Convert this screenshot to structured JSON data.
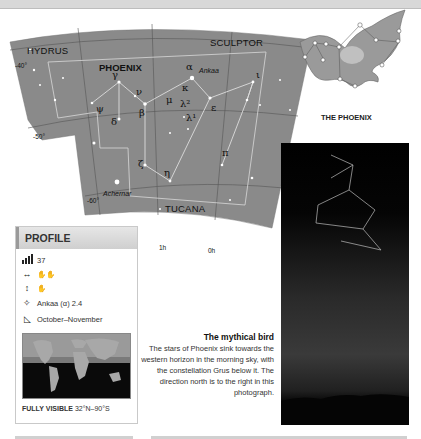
{
  "page": {
    "topbar": ""
  },
  "star_chart": {
    "constellations": {
      "hydrus": "HYDRUS",
      "phoenix": "PHOENIX",
      "sculptor": "SCULPTOR",
      "tucana": "TUCANA"
    },
    "declinations": [
      "-40°",
      "-50°",
      "-60°"
    ],
    "right_ascensions": [
      "1h",
      "0h"
    ],
    "star_names": {
      "ankaa": "Ankaa",
      "achernar": "Achernar"
    },
    "greek_labels": {
      "alpha": "α",
      "gamma": "γ",
      "nu": "ν",
      "beta": "β",
      "psi": "ψ",
      "delta": "δ",
      "mu": "μ",
      "kappa": "κ",
      "lambda2": "λ²",
      "lambda1": "λ¹",
      "epsilon": "ε",
      "iota": "ι",
      "pi": "π",
      "zeta": "ζ",
      "eta": "η"
    }
  },
  "illustration": {
    "title": "THE PHOENIX"
  },
  "profile": {
    "heading": "PROFILE",
    "rows": [
      {
        "icon": "size-rank-icon",
        "glyph": "▮",
        "value": "37"
      },
      {
        "icon": "width-icon",
        "glyph": "↔",
        "value": "✋✋"
      },
      {
        "icon": "height-icon",
        "glyph": "↕",
        "value": "✋"
      },
      {
        "icon": "brightest-star-icon",
        "glyph": "✧",
        "value": "Ankaa (α) 2.4"
      },
      {
        "icon": "best-viewing-icon",
        "glyph": "◺",
        "value": "October–November"
      }
    ],
    "visibility_label": "FULLY VISIBLE",
    "visibility_range": "32°N–90°S"
  },
  "photo_caption": {
    "title": "The mythical bird",
    "body": "The stars of Phoenix sink towards the western horizon in the morning sky, with the constellation Grus below it. The direction north is to the right in this photograph."
  }
}
